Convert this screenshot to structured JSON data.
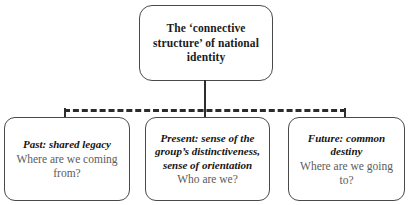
{
  "diagram": {
    "type": "hierarchy",
    "root": {
      "label": "The ‘connective structure’ of national identity"
    },
    "children": [
      {
        "heading": "Past: shared legacy",
        "question": "Where are we coming from?"
      },
      {
        "heading": "Present: sense of the group’s distinctiveness, sense of orientation",
        "question": "Who are we?"
      },
      {
        "heading": "Future: common destiny",
        "question": "Where are we going to?"
      }
    ],
    "colors": {
      "background": "#ffffff",
      "box_border": "#4a4a4a",
      "connector": "#2b2b2b",
      "heading_text": "#141414",
      "question_text": "#5b5b5b"
    },
    "connectors": {
      "trunk_style": "solid",
      "bus_style": "dashed"
    }
  }
}
